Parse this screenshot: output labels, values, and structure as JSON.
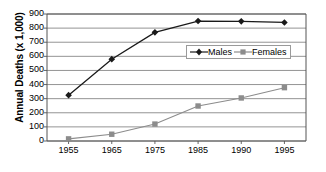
{
  "chart_data": {
    "type": "line",
    "title": "",
    "subtitle": "",
    "xlabel": "",
    "ylabel": "Annual Deaths (x 1,000)",
    "categories": [
      "1955",
      "1965",
      "1975",
      "1985",
      "1990",
      "1995"
    ],
    "x": [
      1955,
      1965,
      1975,
      1985,
      1990,
      1995
    ],
    "series": [
      {
        "name": "Males",
        "color": "#1a1a1a",
        "marker": "diamond",
        "values": [
          325,
          580,
          770,
          850,
          848,
          840
        ]
      },
      {
        "name": "Females",
        "color": "#8c8c8c",
        "marker": "square",
        "values": [
          15,
          48,
          120,
          248,
          305,
          378
        ]
      }
    ],
    "ylim": [
      0,
      900
    ],
    "ytick_step": 100,
    "yticks": [
      "0",
      "100",
      "200",
      "300",
      "400",
      "500",
      "600",
      "700",
      "800",
      "900"
    ],
    "grid": "horizontal",
    "legend_position": "inside-upper-right",
    "legend": [
      "Males",
      "Females"
    ],
    "colors": {
      "males": "#1a1a1a",
      "females": "#8c8c8c",
      "gridline": "#888888",
      "axis": "#555555",
      "background": "#ffffff"
    }
  }
}
